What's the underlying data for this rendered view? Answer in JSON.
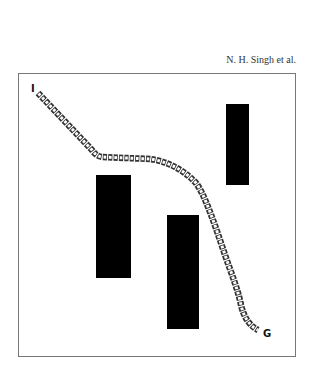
{
  "header": {
    "running_head": "N. H. Singh et al."
  },
  "figure": {
    "frame": {
      "x": 18,
      "y": 73,
      "width": 277,
      "height": 283,
      "stroke": "#777777"
    },
    "start_label": "I",
    "goal_label": "G",
    "obstacles": [
      {
        "x": 96,
        "y": 175,
        "width": 35,
        "height": 103,
        "fill": "#000000"
      },
      {
        "x": 167,
        "y": 215,
        "width": 32,
        "height": 114,
        "fill": "#000000"
      },
      {
        "x": 226,
        "y": 104,
        "width": 23,
        "height": 81,
        "fill": "#000000"
      }
    ],
    "path": {
      "style": "chain of hollow squares",
      "color": "#333333",
      "points": [
        [
          38,
          93
        ],
        [
          92,
          150
        ],
        [
          100,
          157
        ],
        [
          150,
          160
        ],
        [
          165,
          163
        ],
        [
          180,
          170
        ],
        [
          196,
          183
        ],
        [
          210,
          215
        ],
        [
          225,
          255
        ],
        [
          238,
          290
        ],
        [
          242,
          310
        ],
        [
          258,
          330
        ]
      ]
    }
  }
}
